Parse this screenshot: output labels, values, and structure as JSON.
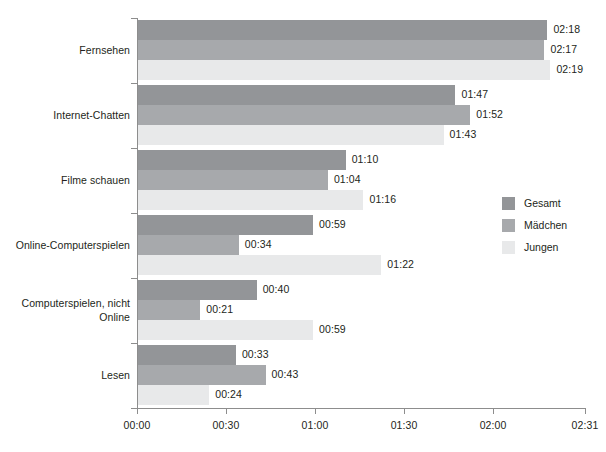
{
  "chart_data": {
    "type": "bar",
    "orientation": "horizontal",
    "title": "",
    "xlabel": "",
    "ylabel": "",
    "grid": false,
    "legend_position": "right",
    "categories": [
      "Fernsehen",
      "Internet-Chatten",
      "Filme schauen",
      "Online-Computerspielen",
      "Computerspielen, nicht\nOnline",
      "Lesen"
    ],
    "series": [
      {
        "name": "Gesamt",
        "color": "#939598",
        "values": [
          "02:18",
          "01:47",
          "01:10",
          "00:59",
          "00:40",
          "00:33"
        ],
        "minutes": [
          138,
          107,
          70,
          59,
          40,
          33
        ]
      },
      {
        "name": "Mädchen",
        "color": "#a7a9ac",
        "values": [
          "02:17",
          "01:52",
          "01:04",
          "00:34",
          "00:21",
          "00:43"
        ],
        "minutes": [
          137,
          112,
          64,
          34,
          21,
          43
        ]
      },
      {
        "name": "Jungen",
        "color": "#e8e9ea",
        "values": [
          "02:19",
          "01:43",
          "01:16",
          "01:22",
          "00:59",
          "00:24"
        ],
        "minutes": [
          139,
          103,
          76,
          82,
          59,
          24
        ]
      }
    ],
    "x_ticks": [
      "00:00",
      "00:30",
      "01:00",
      "01:30",
      "02:00",
      "02:31"
    ],
    "x_tick_minutes": [
      0,
      30,
      60,
      90,
      120,
      151
    ],
    "xlim_minutes": [
      0,
      151
    ],
    "axis_color": "#8d8d8d"
  }
}
